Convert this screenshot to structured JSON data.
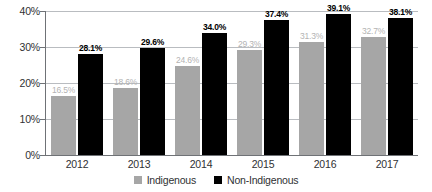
{
  "chart_data": {
    "type": "bar",
    "title": "",
    "xlabel": "",
    "ylabel": "",
    "ylim": [
      0,
      40
    ],
    "yticks": [
      "0%",
      "10%",
      "20%",
      "30%",
      "40%"
    ],
    "grid": true,
    "legend_position": "bottom-center",
    "categories": [
      "2012",
      "2013",
      "2014",
      "2015",
      "2016",
      "2017"
    ],
    "series": [
      {
        "name": "Indigenous",
        "color": "#a6a6a6",
        "values": [
          16.5,
          18.6,
          24.6,
          29.3,
          31.3,
          32.7
        ],
        "labels": [
          "16.5%",
          "18.6%",
          "24.6%",
          "29.3%",
          "31.3%",
          "32.7%"
        ]
      },
      {
        "name": "Non-Indigenous",
        "color": "#000000",
        "values": [
          28.1,
          29.6,
          34.0,
          37.4,
          39.1,
          38.1
        ],
        "labels": [
          "28.1%",
          "29.6%",
          "34.0%",
          "37.4%",
          "39.1%",
          "38.1%"
        ]
      }
    ]
  },
  "legend": {
    "items": [
      {
        "label": "Indigenous",
        "swatch": "gray-square-icon"
      },
      {
        "label": "Non-Indigenous",
        "swatch": "black-square-icon"
      }
    ]
  }
}
